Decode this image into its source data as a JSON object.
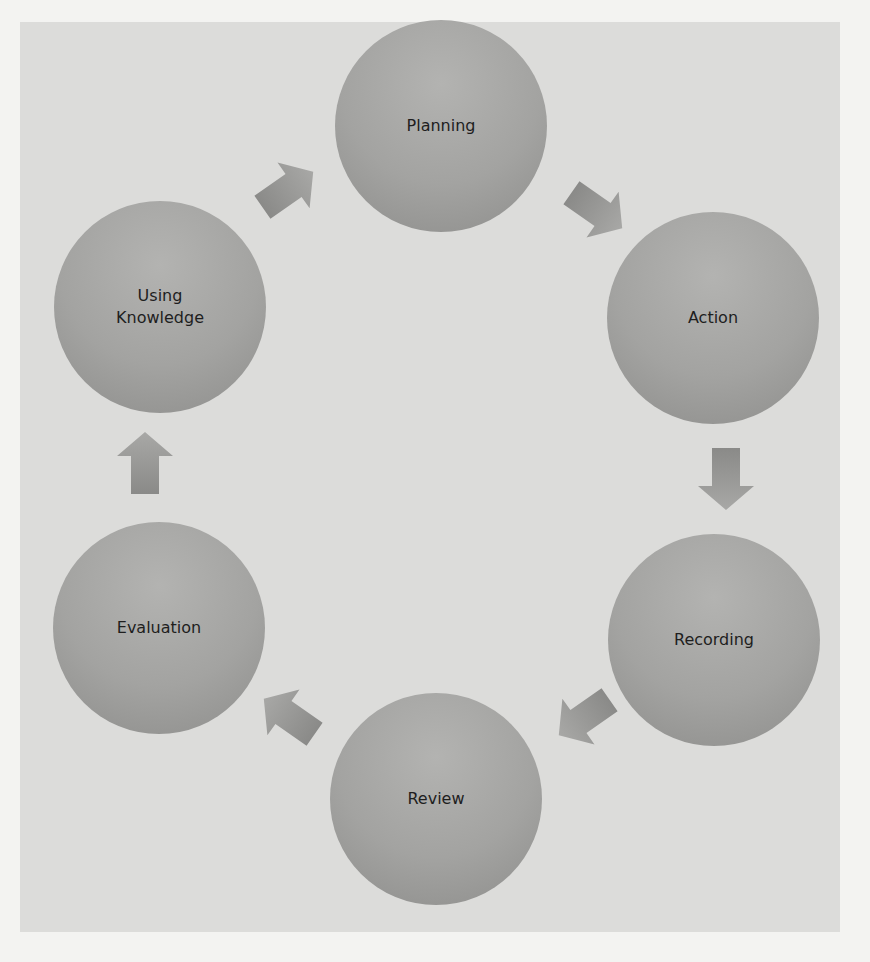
{
  "diagram": {
    "type": "cycle",
    "colors": {
      "page": "#f3f3f1",
      "panel": "#dcdcda",
      "node": "#a3a3a1",
      "arrow": "#8f8f8d",
      "text": "#1e1e1e"
    },
    "nodes": [
      {
        "id": "planning",
        "label": "Planning"
      },
      {
        "id": "action",
        "label": "Action"
      },
      {
        "id": "recording",
        "label": "Recording"
      },
      {
        "id": "review",
        "label": "Review"
      },
      {
        "id": "evaluation",
        "label": "Evaluation"
      },
      {
        "id": "using-knowledge",
        "label": "Using\nKnowledge"
      }
    ],
    "edges": [
      {
        "from": "planning",
        "to": "action"
      },
      {
        "from": "action",
        "to": "recording"
      },
      {
        "from": "recording",
        "to": "review"
      },
      {
        "from": "review",
        "to": "evaluation"
      },
      {
        "from": "evaluation",
        "to": "using-knowledge"
      },
      {
        "from": "using-knowledge",
        "to": "planning"
      }
    ]
  }
}
